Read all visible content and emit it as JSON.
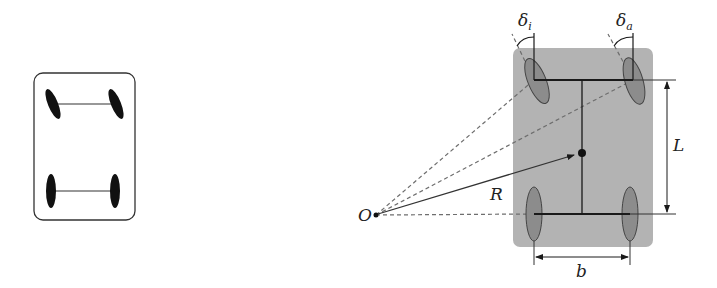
{
  "diagram": {
    "left_panel": {
      "description": "Simple vehicle sketch with steered front wheels and fixed rear wheels"
    },
    "right_panel": {
      "labels": {
        "delta_inner": "δ",
        "delta_inner_sub": "i",
        "delta_outer": "δ",
        "delta_outer_sub": "a",
        "wheelbase": "L",
        "track_width": "b",
        "turn_radius": "R",
        "turn_center": "O"
      },
      "colors": {
        "body_fill": "#b3b3b3",
        "wheel_fill": "#8c8c8c",
        "line": "#1a1a1a",
        "dashed": "#6e6e6e"
      }
    }
  }
}
